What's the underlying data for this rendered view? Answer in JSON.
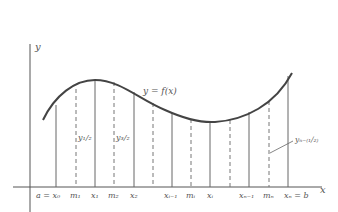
{
  "axes": {
    "x_label": "x",
    "y_label": "y"
  },
  "curve": {
    "label": "y = f(x)",
    "color": "#444444"
  },
  "partition_points": [
    {
      "name": "x0",
      "label": "a = x₀",
      "x": 56
    },
    {
      "name": "x1",
      "label": "x₁",
      "x": 95
    },
    {
      "name": "x2",
      "label": "x₂",
      "x": 134
    },
    {
      "name": "xi-1",
      "label": "xᵢ₋₁",
      "x": 172
    },
    {
      "name": "xi",
      "label": "xᵢ",
      "x": 210
    },
    {
      "name": "xn-1",
      "label": "xₙ₋₁",
      "x": 249
    },
    {
      "name": "xn",
      "label": "xₙ = b",
      "x": 288
    }
  ],
  "midpoints": [
    {
      "name": "m1",
      "label": "m₁",
      "x": 76
    },
    {
      "name": "m2",
      "label": "m₂",
      "x": 114
    },
    {
      "name": "m-unlabeled-1",
      "label": "",
      "x": 153
    },
    {
      "name": "mi",
      "label": "mᵢ",
      "x": 191
    },
    {
      "name": "m-unlabeled-2",
      "label": "",
      "x": 230
    },
    {
      "name": "mn",
      "label": "mₙ",
      "x": 269
    }
  ],
  "ordinate_labels": {
    "y_half": "y₁/₂",
    "y_three_half": "y₃/₂",
    "y_n_minus_half": "yₙ₋₍₁/₂₎"
  }
}
